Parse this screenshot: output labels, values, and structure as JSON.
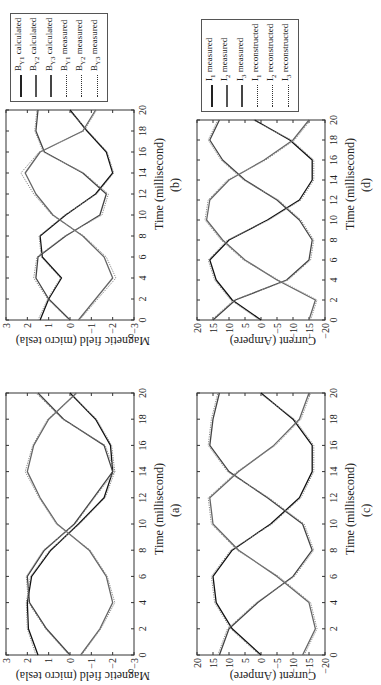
{
  "figure": {
    "orientation": "rotated-90-ccw",
    "panels": [
      {
        "id": "a",
        "caption": "(a)",
        "xlabel": "Time (millisecond)",
        "ylabel": "Magnetic field (micro tesla)"
      },
      {
        "id": "b",
        "caption": "(b)",
        "xlabel": "Time (millisecond)",
        "ylabel": "Magnetic field (micro tesla)"
      },
      {
        "id": "c",
        "caption": "(c)",
        "xlabel": "Time (millisecond)",
        "ylabel": "Current (Ampere)"
      },
      {
        "id": "d",
        "caption": "(d)",
        "xlabel": "Time (millisecond)",
        "ylabel": "Current (Ampere)"
      }
    ],
    "legend_b": {
      "items": [
        {
          "label": "B",
          "sub": "Y1",
          "suffix": " calculated",
          "style": "solid"
        },
        {
          "label": "B",
          "sub": "Y2",
          "suffix": " calculated",
          "style": "solid"
        },
        {
          "label": "B",
          "sub": "Y3",
          "suffix": " calculated",
          "style": "solid"
        },
        {
          "label": "B",
          "sub": "Y1",
          "suffix": " measured",
          "style": "dotted"
        },
        {
          "label": "B",
          "sub": "Y2",
          "suffix": " measured",
          "style": "dotted"
        },
        {
          "label": "B",
          "sub": "Y3",
          "suffix": " measured",
          "style": "dotted"
        }
      ]
    },
    "legend_d": {
      "items": [
        {
          "label": "I",
          "sub": "1",
          "suffix": " measured",
          "style": "solid"
        },
        {
          "label": "I",
          "sub": "2",
          "suffix": " measured",
          "style": "solid"
        },
        {
          "label": "I",
          "sub": "3",
          "suffix": " measured",
          "style": "solid"
        },
        {
          "label": "I",
          "sub": "1",
          "suffix": " reconstructed",
          "style": "dotted"
        },
        {
          "label": "I",
          "sub": "2",
          "suffix": " reconstructed",
          "style": "dotted"
        },
        {
          "label": "I",
          "sub": "3",
          "suffix": " reconstructed",
          "style": "dotted"
        }
      ]
    }
  },
  "chart_data": [
    {
      "panel": "a",
      "type": "line",
      "title": "",
      "xlabel": "Time (millisecond)",
      "ylabel": "Magnetic field (micro tesla)",
      "xlim": [
        0,
        20
      ],
      "ylim": [
        -3,
        3
      ],
      "xticks": [
        0,
        2,
        4,
        6,
        8,
        10,
        12,
        14,
        16,
        18,
        20
      ],
      "yticks": [
        -3,
        -2,
        -1,
        0,
        1,
        2,
        3
      ],
      "grid": false,
      "waveform": {
        "amplitude": 2.05,
        "period_ms": 20,
        "shape": "flat-topped sinusoid (saturated)"
      },
      "series": [
        {
          "name": "B_Y1 calculated",
          "style": "solid",
          "phase_deg": 0,
          "x": [
            0,
            2,
            4,
            6,
            8,
            10,
            12,
            14,
            16,
            18,
            20
          ],
          "values": [
            1.5,
            1.95,
            2.0,
            1.8,
            0.9,
            -0.4,
            -1.6,
            -2.0,
            -1.9,
            -1.2,
            0.0
          ]
        },
        {
          "name": "B_Y2 calculated",
          "style": "solid",
          "phase_deg": 120,
          "x": [
            0,
            2,
            4,
            6,
            8,
            10,
            12,
            14,
            16,
            18,
            20
          ],
          "values": [
            0.0,
            1.1,
            1.9,
            2.0,
            1.2,
            -0.2,
            -1.1,
            -2.0,
            -1.6,
            0.3,
            1.5
          ]
        },
        {
          "name": "B_Y3 calculated",
          "style": "solid",
          "phase_deg": 240,
          "x": [
            0,
            2,
            4,
            6,
            8,
            10,
            12,
            14,
            16,
            18,
            20
          ],
          "values": [
            -0.5,
            -1.4,
            -2.0,
            -1.7,
            -0.9,
            0.6,
            1.4,
            2.0,
            1.7,
            1.0,
            -0.3
          ]
        },
        {
          "name": "B_Y1 measured",
          "style": "dotted",
          "x": [
            0,
            2,
            4,
            6,
            8,
            10,
            12,
            14,
            16,
            18,
            20
          ],
          "values": [
            1.6,
            2.0,
            2.05,
            1.85,
            0.95,
            -0.45,
            -1.65,
            -2.1,
            -1.95,
            -1.25,
            0.05
          ]
        },
        {
          "name": "B_Y2 measured",
          "style": "dotted",
          "x": [
            0,
            2,
            4,
            6,
            8,
            10,
            12,
            14,
            16,
            18,
            20
          ],
          "values": [
            0.05,
            1.15,
            1.95,
            2.05,
            1.25,
            -0.25,
            -1.15,
            -2.1,
            -1.65,
            0.35,
            1.6
          ]
        },
        {
          "name": "B_Y3 measured",
          "style": "dotted",
          "x": [
            0,
            2,
            4,
            6,
            8,
            10,
            12,
            14,
            16,
            18,
            20
          ],
          "values": [
            -0.55,
            -1.45,
            -2.1,
            -1.75,
            -0.95,
            0.65,
            1.45,
            2.1,
            1.75,
            1.05,
            -0.35
          ]
        }
      ]
    },
    {
      "panel": "b",
      "type": "line",
      "xlabel": "Time (millisecond)",
      "ylabel": "Magnetic field (micro tesla)",
      "xlim": [
        0,
        20
      ],
      "ylim": [
        -3,
        3
      ],
      "xticks": [
        0,
        2,
        4,
        6,
        8,
        10,
        12,
        14,
        16,
        18,
        20
      ],
      "yticks": [
        -3,
        -2,
        -1,
        0,
        1,
        2,
        3
      ],
      "grid": false,
      "legend": [
        "B_Y1 calculated",
        "B_Y2 calculated",
        "B_Y3 calculated",
        "B_Y1 measured",
        "B_Y2 measured",
        "B_Y3 measured"
      ],
      "legend_position": "outside right, top",
      "series": [
        {
          "name": "B_Y1 calculated",
          "style": "solid",
          "phase_deg": 0,
          "x": [
            0,
            2,
            4,
            6,
            8,
            10,
            12,
            14,
            16,
            18,
            20
          ],
          "values": [
            1.4,
            1.0,
            0.4,
            1.3,
            1.4,
            0.2,
            -1.2,
            -2.0,
            -1.7,
            -0.8,
            0.0
          ]
        },
        {
          "name": "B_Y2 calculated",
          "style": "solid",
          "phase_deg": 120,
          "x": [
            0,
            2,
            4,
            6,
            8,
            10,
            12,
            14,
            16,
            18,
            20
          ],
          "values": [
            0.0,
            1.0,
            1.6,
            1.5,
            0.2,
            -1.4,
            -1.7,
            -0.6,
            1.2,
            1.6,
            1.5
          ]
        },
        {
          "name": "B_Y3 calculated",
          "style": "solid",
          "phase_deg": 240,
          "x": [
            0,
            2,
            4,
            6,
            8,
            10,
            12,
            14,
            16,
            18,
            20
          ],
          "values": [
            -0.4,
            -1.2,
            -2.0,
            -1.6,
            -0.6,
            0.8,
            1.6,
            2.1,
            1.4,
            -0.6,
            -1.2
          ]
        },
        {
          "name": "B_Y1 measured",
          "style": "dotted",
          "x": [
            0,
            2,
            4,
            6,
            8,
            10,
            12,
            14,
            16,
            18,
            20
          ],
          "values": [
            1.5,
            1.05,
            0.45,
            1.35,
            1.45,
            0.25,
            -1.25,
            -2.05,
            -1.75,
            -0.85,
            0.05
          ]
        },
        {
          "name": "B_Y2 measured",
          "style": "dotted",
          "x": [
            0,
            2,
            4,
            6,
            8,
            10,
            12,
            14,
            16,
            18,
            20
          ],
          "values": [
            0.05,
            1.05,
            1.7,
            1.55,
            0.25,
            -1.5,
            -1.8,
            -0.65,
            1.25,
            1.65,
            1.55
          ]
        },
        {
          "name": "B_Y3 measured",
          "style": "dotted",
          "x": [
            0,
            2,
            4,
            6,
            8,
            10,
            12,
            14,
            16,
            18,
            20
          ],
          "values": [
            -0.45,
            -1.3,
            -2.15,
            -1.7,
            -0.65,
            0.85,
            1.7,
            2.3,
            1.45,
            -0.65,
            -1.25
          ]
        }
      ]
    },
    {
      "panel": "c",
      "type": "line",
      "xlabel": "Time (millisecond)",
      "ylabel": "Current (Ampere)",
      "xlim": [
        0,
        20
      ],
      "ylim": [
        -20,
        20
      ],
      "xticks": [
        0,
        2,
        4,
        6,
        8,
        10,
        12,
        14,
        16,
        18,
        20
      ],
      "yticks": [
        -20,
        -15,
        -10,
        -5,
        0,
        5,
        10,
        15,
        20
      ],
      "grid": false,
      "series": [
        {
          "name": "I1 measured",
          "style": "solid",
          "x": [
            0,
            2,
            4,
            6,
            8,
            10,
            12,
            14,
            16,
            18,
            20
          ],
          "values": [
            0,
            9,
            14,
            15,
            9,
            -3,
            -12,
            -16,
            -16,
            -10,
            0
          ]
        },
        {
          "name": "I2 measured",
          "style": "solid",
          "x": [
            0,
            2,
            4,
            6,
            8,
            10,
            12,
            14,
            16,
            18,
            20
          ],
          "values": [
            13,
            10,
            1,
            -10,
            -16,
            -13,
            -2,
            10,
            16,
            15,
            13
          ]
        },
        {
          "name": "I3 measured",
          "style": "solid",
          "x": [
            0,
            2,
            4,
            6,
            8,
            10,
            12,
            14,
            16,
            18,
            20
          ],
          "values": [
            -13,
            -17,
            -15,
            -5,
            7,
            15,
            16,
            7,
            -4,
            -12,
            -15
          ]
        },
        {
          "name": "I1 reconstructed",
          "style": "dotted",
          "x": [
            0,
            2,
            4,
            6,
            8,
            10,
            12,
            14,
            16,
            18,
            20
          ],
          "values": [
            0.5,
            9.5,
            14.5,
            15.5,
            9.5,
            -3.5,
            -12.5,
            -16.5,
            -16.5,
            -10.5,
            0.5
          ]
        },
        {
          "name": "I2 reconstructed",
          "style": "dotted",
          "x": [
            0,
            2,
            4,
            6,
            8,
            10,
            12,
            14,
            16,
            18,
            20
          ],
          "values": [
            13.5,
            10.5,
            1.5,
            -10.5,
            -16.5,
            -13.5,
            -2.5,
            10.5,
            16.5,
            15.5,
            13.5
          ]
        },
        {
          "name": "I3 reconstructed",
          "style": "dotted",
          "x": [
            0,
            2,
            4,
            6,
            8,
            10,
            12,
            14,
            16,
            18,
            20
          ],
          "values": [
            -13.5,
            -17.5,
            -15.5,
            -5.5,
            7.5,
            15.5,
            16.5,
            7.5,
            -4.5,
            -12.5,
            -15.5
          ]
        }
      ]
    },
    {
      "panel": "d",
      "type": "line",
      "xlabel": "Time (millisecond)",
      "ylabel": "Current (Ampere)",
      "xlim": [
        0,
        20
      ],
      "ylim": [
        -20,
        20
      ],
      "xticks": [
        0,
        2,
        4,
        6,
        8,
        10,
        12,
        14,
        16,
        18,
        20
      ],
      "yticks": [
        -20,
        -15,
        -10,
        -5,
        0,
        5,
        10,
        15,
        20
      ],
      "grid": false,
      "legend": [
        "I1 measured",
        "I2 measured",
        "I3 measured",
        "I1 reconstructed",
        "I2 reconstructed",
        "I3 reconstructed"
      ],
      "legend_position": "outside right, top",
      "series": [
        {
          "name": "I1 measured",
          "style": "solid",
          "x": [
            0,
            2,
            4,
            6,
            8,
            10,
            12,
            14,
            16,
            18,
            20
          ],
          "values": [
            0,
            9,
            14,
            16,
            10,
            -2,
            -12,
            -16,
            -16,
            -9,
            2
          ]
        },
        {
          "name": "I2 measured",
          "style": "solid",
          "x": [
            0,
            2,
            4,
            6,
            8,
            10,
            12,
            14,
            16,
            18,
            20
          ],
          "values": [
            15,
            8,
            -8,
            -15,
            -16,
            -12,
            -5,
            5,
            12,
            16,
            13
          ]
        },
        {
          "name": "I3 measured",
          "style": "solid",
          "x": [
            0,
            2,
            4,
            6,
            8,
            10,
            12,
            14,
            16,
            18,
            20
          ],
          "values": [
            -15,
            -17,
            -5,
            5,
            12,
            17,
            16,
            10,
            -1,
            -10,
            -15
          ]
        },
        {
          "name": "I1 reconstructed",
          "style": "dotted",
          "x": [
            0,
            2,
            4,
            6,
            8,
            10,
            12,
            14,
            16,
            18,
            20
          ],
          "values": [
            0.5,
            9.5,
            14.5,
            16.5,
            10.5,
            -2.5,
            -12.5,
            -16.5,
            -16.5,
            -9.5,
            2.5
          ]
        },
        {
          "name": "I2 reconstructed",
          "style": "dotted",
          "x": [
            0,
            2,
            4,
            6,
            8,
            10,
            12,
            14,
            16,
            18,
            20
          ],
          "values": [
            15.5,
            8.5,
            -8.5,
            -15.5,
            -16.5,
            -12.5,
            -5.5,
            5.5,
            12.5,
            16.5,
            13.5
          ]
        },
        {
          "name": "I3 reconstructed",
          "style": "dotted",
          "x": [
            0,
            2,
            4,
            6,
            8,
            10,
            12,
            14,
            16,
            18,
            20
          ],
          "values": [
            -15.5,
            -17.5,
            -5.5,
            5.5,
            12.5,
            17.5,
            16.5,
            10.5,
            -1.5,
            -10.5,
            -15.5
          ]
        }
      ]
    }
  ]
}
